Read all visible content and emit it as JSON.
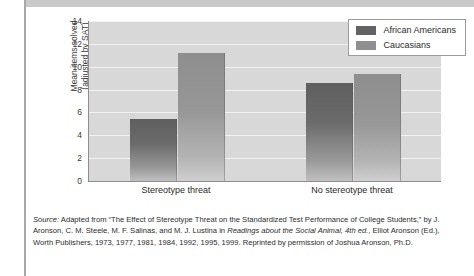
{
  "chart_data": {
    "type": "bar",
    "title": "",
    "xlabel": "",
    "ylabel": "Mean items solved (adjusted by SAT)",
    "ylabel_line1": "Mean items solved",
    "ylabel_line2": "(adjusted by SAT)",
    "categories": [
      "Stereotype threat",
      "No stereotype threat"
    ],
    "series": [
      {
        "name": "African Americans",
        "values": [
          5.4,
          8.6
        ],
        "color": "#636363"
      },
      {
        "name": "Caucasians",
        "values": [
          11.2,
          9.4
        ],
        "color": "#8f8f8f"
      }
    ],
    "ylim": [
      0,
      14
    ],
    "yticks": [
      0,
      2,
      4,
      6,
      8,
      10,
      12,
      14
    ],
    "ytick_labels": [
      "0",
      "2",
      "4",
      "6",
      "8",
      "10",
      "12",
      "14"
    ],
    "grid": true,
    "legend_position": "top-right",
    "plot_background": "#d8d8d8"
  },
  "legend": {
    "items": [
      {
        "label": "African Americans",
        "swatch": "dark"
      },
      {
        "label": "Caucasians",
        "swatch": "light"
      }
    ]
  },
  "caption": {
    "source_word": "Source:",
    "part1": " Adapted from “The Effect of Stereotype Threat on the Standardized Test Performance of College Students,” by J. Aronson, C. M. Steele, M. F. Salinas, and M. J. Lustina in ",
    "italic1": "Readings about the Social Animal, 4th ed.",
    "part2": ", Elliot Aronson (Ed.), Worth Publishers, 1973, 1977, 1981, 1984, 1992, 1995, 1999.  Reprinted by permission of Joshua Aronson, Ph.D."
  }
}
